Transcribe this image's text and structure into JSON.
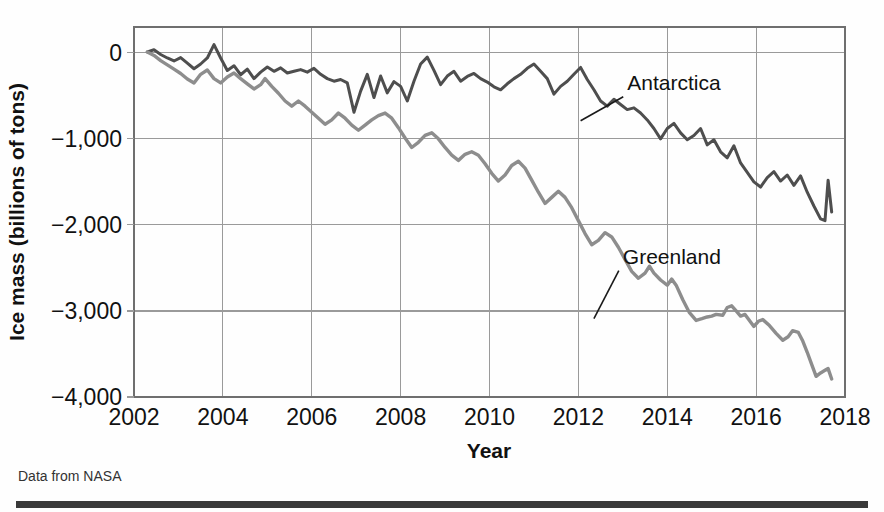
{
  "figure": {
    "source_note": "Data from NASA",
    "background_color": "#fefefe",
    "rule_color": "#3a3a3a"
  },
  "chart_data": {
    "type": "line",
    "title": "",
    "xlabel": "Year",
    "ylabel": "Ice mass (billions of tons)",
    "xlim": [
      2002,
      2018
    ],
    "ylim": [
      -4000,
      300
    ],
    "xticks": [
      2002,
      2004,
      2006,
      2008,
      2010,
      2012,
      2014,
      2016,
      2018
    ],
    "xtick_labels": [
      "2002",
      "2004",
      "2006",
      "2008",
      "2010",
      "2012",
      "2014",
      "2016",
      "2018"
    ],
    "yticks": [
      0,
      -1000,
      -2000,
      -3000,
      -4000
    ],
    "ytick_labels": [
      "0",
      "−1,000",
      "−2,000",
      "−3,000",
      "−4,000"
    ],
    "grid": true,
    "grid_color": "#9a9a9a",
    "legend_position": "inline-annotation",
    "annotations": [
      {
        "text": "Antarctica",
        "x": 2013.1,
        "y": -430,
        "point_x": 2012.05,
        "point_y": -790
      },
      {
        "text": "Greenland",
        "x": 2013.0,
        "y": -2450,
        "point_x": 2012.35,
        "point_y": -3090
      }
    ],
    "series": [
      {
        "name": "Antarctica",
        "color": "#4e4e4e",
        "width": 3.0,
        "points": [
          [
            2002.3,
            10
          ],
          [
            2002.45,
            35
          ],
          [
            2002.6,
            -20
          ],
          [
            2002.75,
            -60
          ],
          [
            2002.9,
            -95
          ],
          [
            2003.05,
            -55
          ],
          [
            2003.2,
            -120
          ],
          [
            2003.35,
            -185
          ],
          [
            2003.5,
            -130
          ],
          [
            2003.65,
            -60
          ],
          [
            2003.8,
            95
          ],
          [
            2003.95,
            -60
          ],
          [
            2004.1,
            -205
          ],
          [
            2004.25,
            -150
          ],
          [
            2004.4,
            -255
          ],
          [
            2004.55,
            -190
          ],
          [
            2004.7,
            -300
          ],
          [
            2004.85,
            -225
          ],
          [
            2005.0,
            -165
          ],
          [
            2005.15,
            -215
          ],
          [
            2005.3,
            -175
          ],
          [
            2005.45,
            -235
          ],
          [
            2005.6,
            -215
          ],
          [
            2005.75,
            -195
          ],
          [
            2005.9,
            -225
          ],
          [
            2006.05,
            -180
          ],
          [
            2006.2,
            -250
          ],
          [
            2006.35,
            -300
          ],
          [
            2006.5,
            -330
          ],
          [
            2006.65,
            -310
          ],
          [
            2006.8,
            -350
          ],
          [
            2006.95,
            -690
          ],
          [
            2007.1,
            -445
          ],
          [
            2007.25,
            -250
          ],
          [
            2007.4,
            -520
          ],
          [
            2007.55,
            -270
          ],
          [
            2007.7,
            -465
          ],
          [
            2007.85,
            -335
          ],
          [
            2008.0,
            -390
          ],
          [
            2008.15,
            -560
          ],
          [
            2008.3,
            -330
          ],
          [
            2008.45,
            -130
          ],
          [
            2008.6,
            -50
          ],
          [
            2008.75,
            -205
          ],
          [
            2008.9,
            -370
          ],
          [
            2009.05,
            -270
          ],
          [
            2009.2,
            -215
          ],
          [
            2009.35,
            -330
          ],
          [
            2009.5,
            -275
          ],
          [
            2009.65,
            -240
          ],
          [
            2009.8,
            -300
          ],
          [
            2009.95,
            -340
          ],
          [
            2010.1,
            -395
          ],
          [
            2010.25,
            -430
          ],
          [
            2010.4,
            -360
          ],
          [
            2010.55,
            -300
          ],
          [
            2010.7,
            -250
          ],
          [
            2010.85,
            -180
          ],
          [
            2011.0,
            -130
          ],
          [
            2011.15,
            -215
          ],
          [
            2011.3,
            -300
          ],
          [
            2011.45,
            -480
          ],
          [
            2011.6,
            -390
          ],
          [
            2011.75,
            -330
          ],
          [
            2011.9,
            -250
          ],
          [
            2012.05,
            -170
          ],
          [
            2012.2,
            -310
          ],
          [
            2012.35,
            -430
          ],
          [
            2012.5,
            -560
          ],
          [
            2012.65,
            -620
          ],
          [
            2012.8,
            -540
          ],
          [
            2012.95,
            -600
          ],
          [
            2013.1,
            -660
          ],
          [
            2013.25,
            -640
          ],
          [
            2013.4,
            -700
          ],
          [
            2013.55,
            -780
          ],
          [
            2013.7,
            -880
          ],
          [
            2013.85,
            -1000
          ],
          [
            2014.0,
            -880
          ],
          [
            2014.15,
            -820
          ],
          [
            2014.3,
            -930
          ],
          [
            2014.45,
            -1010
          ],
          [
            2014.6,
            -960
          ],
          [
            2014.75,
            -880
          ],
          [
            2014.9,
            -1070
          ],
          [
            2015.05,
            -1010
          ],
          [
            2015.2,
            -1150
          ],
          [
            2015.35,
            -1220
          ],
          [
            2015.5,
            -1080
          ],
          [
            2015.65,
            -1280
          ],
          [
            2015.8,
            -1390
          ],
          [
            2015.95,
            -1500
          ],
          [
            2016.1,
            -1560
          ],
          [
            2016.25,
            -1450
          ],
          [
            2016.4,
            -1380
          ],
          [
            2016.55,
            -1490
          ],
          [
            2016.7,
            -1420
          ],
          [
            2016.85,
            -1540
          ],
          [
            2017.0,
            -1430
          ],
          [
            2017.15,
            -1620
          ],
          [
            2017.3,
            -1780
          ],
          [
            2017.45,
            -1930
          ],
          [
            2017.55,
            -1950
          ],
          [
            2017.62,
            -1480
          ],
          [
            2017.7,
            -1850
          ]
        ]
      },
      {
        "name": "Greenland",
        "color": "#8d8d8d",
        "width": 3.4,
        "points": [
          [
            2002.3,
            10
          ],
          [
            2002.45,
            -30
          ],
          [
            2002.6,
            -90
          ],
          [
            2002.75,
            -140
          ],
          [
            2002.9,
            -190
          ],
          [
            2003.05,
            -240
          ],
          [
            2003.2,
            -305
          ],
          [
            2003.35,
            -350
          ],
          [
            2003.5,
            -250
          ],
          [
            2003.65,
            -200
          ],
          [
            2003.8,
            -300
          ],
          [
            2003.95,
            -350
          ],
          [
            2004.1,
            -280
          ],
          [
            2004.25,
            -235
          ],
          [
            2004.4,
            -300
          ],
          [
            2004.55,
            -360
          ],
          [
            2004.7,
            -420
          ],
          [
            2004.85,
            -370
          ],
          [
            2004.95,
            -300
          ],
          [
            2005.1,
            -390
          ],
          [
            2005.25,
            -470
          ],
          [
            2005.4,
            -560
          ],
          [
            2005.55,
            -620
          ],
          [
            2005.7,
            -560
          ],
          [
            2005.85,
            -620
          ],
          [
            2006.0,
            -690
          ],
          [
            2006.15,
            -760
          ],
          [
            2006.3,
            -830
          ],
          [
            2006.45,
            -780
          ],
          [
            2006.6,
            -700
          ],
          [
            2006.75,
            -760
          ],
          [
            2006.9,
            -840
          ],
          [
            2007.05,
            -900
          ],
          [
            2007.2,
            -840
          ],
          [
            2007.35,
            -780
          ],
          [
            2007.5,
            -730
          ],
          [
            2007.65,
            -700
          ],
          [
            2007.8,
            -760
          ],
          [
            2007.95,
            -870
          ],
          [
            2008.1,
            -990
          ],
          [
            2008.25,
            -1100
          ],
          [
            2008.4,
            -1040
          ],
          [
            2008.55,
            -960
          ],
          [
            2008.7,
            -930
          ],
          [
            2008.85,
            -1000
          ],
          [
            2009.0,
            -1100
          ],
          [
            2009.15,
            -1190
          ],
          [
            2009.3,
            -1250
          ],
          [
            2009.45,
            -1180
          ],
          [
            2009.6,
            -1150
          ],
          [
            2009.75,
            -1190
          ],
          [
            2009.9,
            -1290
          ],
          [
            2010.05,
            -1400
          ],
          [
            2010.2,
            -1490
          ],
          [
            2010.35,
            -1420
          ],
          [
            2010.5,
            -1310
          ],
          [
            2010.65,
            -1260
          ],
          [
            2010.8,
            -1340
          ],
          [
            2010.95,
            -1480
          ],
          [
            2011.1,
            -1620
          ],
          [
            2011.25,
            -1750
          ],
          [
            2011.4,
            -1680
          ],
          [
            2011.55,
            -1610
          ],
          [
            2011.7,
            -1680
          ],
          [
            2011.85,
            -1800
          ],
          [
            2012.0,
            -1950
          ],
          [
            2012.15,
            -2100
          ],
          [
            2012.3,
            -2230
          ],
          [
            2012.45,
            -2180
          ],
          [
            2012.6,
            -2090
          ],
          [
            2012.75,
            -2140
          ],
          [
            2012.9,
            -2260
          ],
          [
            2013.05,
            -2400
          ],
          [
            2013.2,
            -2540
          ],
          [
            2013.35,
            -2620
          ],
          [
            2013.5,
            -2560
          ],
          [
            2013.6,
            -2480
          ],
          [
            2013.7,
            -2560
          ],
          [
            2013.85,
            -2640
          ],
          [
            2014.0,
            -2700
          ],
          [
            2014.1,
            -2630
          ],
          [
            2014.2,
            -2700
          ],
          [
            2014.35,
            -2870
          ],
          [
            2014.5,
            -3020
          ],
          [
            2014.65,
            -3110
          ],
          [
            2014.78,
            -3090
          ],
          [
            2014.9,
            -3070
          ],
          [
            2015.0,
            -3060
          ],
          [
            2015.1,
            -3040
          ],
          [
            2015.25,
            -3050
          ],
          [
            2015.35,
            -2960
          ],
          [
            2015.45,
            -2940
          ],
          [
            2015.55,
            -3000
          ],
          [
            2015.65,
            -3060
          ],
          [
            2015.75,
            -3040
          ],
          [
            2015.85,
            -3110
          ],
          [
            2015.95,
            -3180
          ],
          [
            2016.05,
            -3120
          ],
          [
            2016.15,
            -3100
          ],
          [
            2016.3,
            -3170
          ],
          [
            2016.45,
            -3260
          ],
          [
            2016.6,
            -3340
          ],
          [
            2016.72,
            -3300
          ],
          [
            2016.82,
            -3230
          ],
          [
            2016.95,
            -3250
          ],
          [
            2017.05,
            -3350
          ],
          [
            2017.15,
            -3480
          ],
          [
            2017.25,
            -3620
          ],
          [
            2017.35,
            -3760
          ],
          [
            2017.45,
            -3720
          ],
          [
            2017.55,
            -3690
          ],
          [
            2017.62,
            -3670
          ],
          [
            2017.7,
            -3790
          ]
        ]
      }
    ]
  }
}
